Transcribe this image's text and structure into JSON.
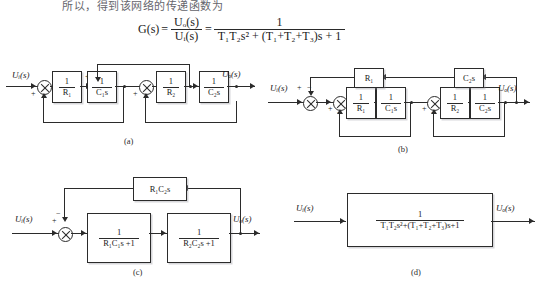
{
  "top_text": "所以，得到该网络的传递函数为",
  "formula": {
    "lhs": "G(s)",
    "eq": "=",
    "ratio_num": "Uₒ(s)",
    "ratio_den": "Uᵢ(s)",
    "eq2": "=",
    "frac_num": "1",
    "frac_den": "T₁T₂s² + (T₁+T₂+T₃)s + 1"
  },
  "signals": {
    "input": "Uᵢ(s)",
    "output": "Uₒ(s)"
  },
  "signs": {
    "plus": "+",
    "minus": "−"
  },
  "diagrams": [
    {
      "id": "a",
      "caption": "(a)",
      "input_label": "Uᵢ(s)",
      "output_label": "Uₒ(s)",
      "blocks": [
        {
          "name": "block-inv-r1",
          "num": "1",
          "den": "R₁"
        },
        {
          "name": "block-inv-c1s",
          "num": "1",
          "den": "C₁s"
        },
        {
          "name": "block-inv-r2",
          "num": "1",
          "den": "R₂"
        },
        {
          "name": "block-inv-c2s",
          "num": "1",
          "den": "C₂s"
        }
      ]
    },
    {
      "id": "b",
      "caption": "(b)",
      "input_label": "Uᵢ(s)",
      "output_label": "Uₒ(s)",
      "feedback_blocks": [
        {
          "name": "feedback-block-r1",
          "label": "R₁"
        },
        {
          "name": "feedback-block-c2s",
          "label": "C₂s"
        }
      ],
      "blocks": [
        {
          "name": "block-inv-r1",
          "num": "1",
          "den": "R₁"
        },
        {
          "name": "block-inv-c1s",
          "num": "1",
          "den": "C₁s"
        },
        {
          "name": "block-inv-r2",
          "num": "1",
          "den": "R₂"
        },
        {
          "name": "block-inv-c2s",
          "num": "1",
          "den": "C₂s"
        }
      ]
    },
    {
      "id": "c",
      "caption": "(c)",
      "input_label": "Uᵢ(s)",
      "output_label": "Uₒ(s)",
      "feedback_block": {
        "name": "feedback-block-r1c2s",
        "label": "R₁C₂s"
      },
      "blocks": [
        {
          "name": "block-lag-1",
          "num": "1",
          "den": "R₁C₁s +1"
        },
        {
          "name": "block-lag-2",
          "num": "1",
          "den": "R₂C₂s +1"
        }
      ]
    },
    {
      "id": "d",
      "caption": "(d)",
      "input_label": "Uᵢ(s)",
      "output_label": "Uₒ(s)",
      "block": {
        "name": "block-transfer-function",
        "num": "1",
        "den": "T₁T₂s²+(T₁+T₂+T₃)s+1"
      }
    }
  ]
}
